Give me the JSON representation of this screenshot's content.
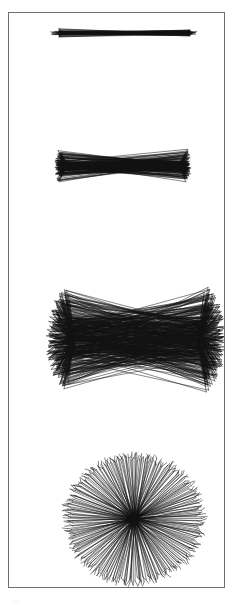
{
  "page": {
    "background_color": "#ffffff",
    "width": 236,
    "height": 612
  },
  "plate": {
    "border_color": "#6d6d6d",
    "background_color": "#ffffff",
    "x": 8,
    "y": 12,
    "width": 217,
    "height": 576
  },
  "caption": {
    "marginalia_text": "··"
  },
  "chart_data": {
    "type": "line",
    "title": "",
    "subtitle": "",
    "xlabel": "",
    "ylabel": "",
    "grid": false,
    "legend_position": "none",
    "ink_color": "#111111",
    "panels": [
      {
        "index": 1,
        "name": "thin-dumbbell",
        "label": "",
        "center_x": 107,
        "center_y": 32,
        "left_hub_x": 62,
        "right_hub_x": 185,
        "ray_count": 26,
        "fan_half_angle_deg": 26,
        "spread_y": 9,
        "waist_y": 1.6,
        "stroke_width": 0.55,
        "opacity": 0.95
      },
      {
        "index": 2,
        "name": "pinched-bowtie",
        "label": "",
        "center_x": 113,
        "center_y": 165,
        "left_hub_x": 67,
        "right_hub_x": 177,
        "ray_count": 78,
        "fan_half_angle_deg": 42,
        "spread_y": 25,
        "waist_y": 5.0,
        "stroke_width": 0.55,
        "opacity": 0.95
      },
      {
        "index": 3,
        "name": "wide-butterfly",
        "label": "",
        "center_x": 134,
        "center_y": 338,
        "left_hub_x": 74,
        "right_hub_x": 196,
        "ray_count": 190,
        "fan_half_angle_deg": 72,
        "spread_y": 56,
        "waist_y": 20,
        "stroke_width": 0.55,
        "opacity": 0.92
      },
      {
        "index": 4,
        "name": "radial-starburst",
        "label": "",
        "center_x": 133,
        "center_y": 518,
        "radius_x": 68,
        "radius_y": 64,
        "ray_count": 300,
        "fan_half_angle_deg": 180,
        "stroke_width": 0.55,
        "opacity": 0.92
      }
    ]
  }
}
